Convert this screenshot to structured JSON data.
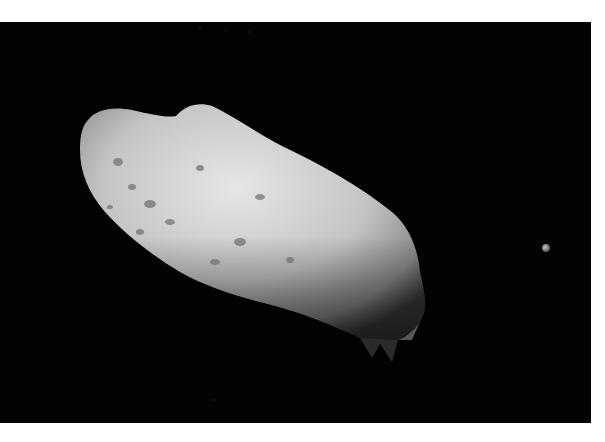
{
  "image": {
    "subject": "Asteroid with small moon against black space",
    "alt": "Grayscale photograph of an elongated, cratered asteroid with a tiny moon to its right",
    "colors": {
      "background": "#ffffff",
      "space": "#020202",
      "asteroid_light": "#d8d8d8",
      "asteroid_mid": "#a8a8a8",
      "asteroid_shadow": "#3a3a3a",
      "moon": "#9a9a9a"
    }
  }
}
